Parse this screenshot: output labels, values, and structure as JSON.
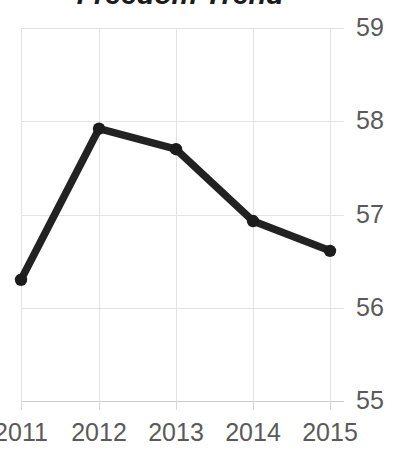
{
  "chart_data": {
    "type": "line",
    "title": "Freedom Trend",
    "xlabel": "",
    "ylabel": "",
    "categories": [
      "2011",
      "2012",
      "2013",
      "2014",
      "2015"
    ],
    "values": [
      56.3,
      57.92,
      57.7,
      56.93,
      56.61
    ],
    "series": [
      {
        "name": "Freedom Trend",
        "values": [
          56.3,
          57.92,
          57.7,
          56.93,
          56.61
        ]
      }
    ],
    "ylim": [
      55,
      59
    ],
    "yticks": [
      "55",
      "56",
      "57",
      "58",
      "59"
    ],
    "xticks": [
      "2011",
      "2012",
      "2013",
      "2014",
      "2015"
    ],
    "grid": true,
    "legend": false,
    "legend_position": "none",
    "y_axis_side": "right",
    "marker": "circle",
    "colors": {
      "series_line": "#222222",
      "marker": "#1c1c1c",
      "gridline": "#e3e3e3",
      "axis": "#cfcfcf",
      "tick_label": "#5a5a5a",
      "title": "#1c1c1c",
      "background": "#ffffff"
    }
  }
}
